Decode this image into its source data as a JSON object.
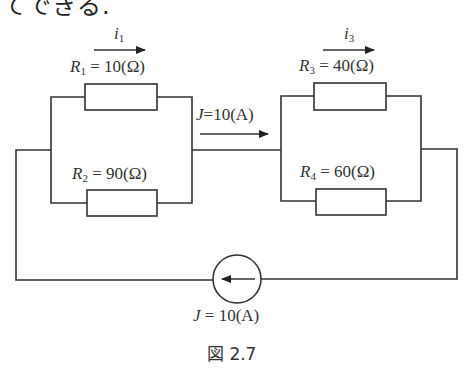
{
  "top_text": "てできる.",
  "currents": {
    "i1": {
      "symbol": "i",
      "sub": "1"
    },
    "i3": {
      "symbol": "i",
      "sub": "3"
    }
  },
  "resistors": [
    {
      "symbol": "R",
      "sub": "1",
      "eq": " = 10(Ω)",
      "value_ohm": 10
    },
    {
      "symbol": "R",
      "sub": "2",
      "eq": " = 90(Ω)",
      "value_ohm": 90
    },
    {
      "symbol": "R",
      "sub": "3",
      "eq": " = 40(Ω)",
      "value_ohm": 40
    },
    {
      "symbol": "R",
      "sub": "4",
      "eq": " = 60(Ω)",
      "value_ohm": 60
    }
  ],
  "middle_current": {
    "symbol": "J",
    "eq": "=10(A)"
  },
  "source": {
    "symbol": "J",
    "eq": " = 10(A)",
    "value_a": 10,
    "direction": "left"
  },
  "caption": "図 2.7"
}
